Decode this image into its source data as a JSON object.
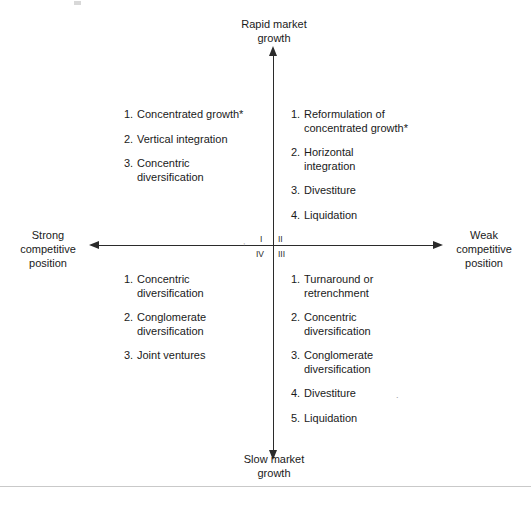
{
  "figure": {
    "type": "grand-strategy-selection-matrix",
    "axes": {
      "top_label": "Rapid market\ngrowth",
      "bottom_label": "Slow market\ngrowth",
      "left_label": "Strong\ncompetitive\nposition",
      "right_label": "Weak\ncompetitive\nposition"
    },
    "quadrant_numerals": {
      "top_left": "I",
      "top_right": "II",
      "bottom_right": "III",
      "bottom_left": "IV"
    },
    "artifacts": {
      "center_comma": ",",
      "divestiture_dot": "."
    },
    "quadrants": [
      {
        "id": "quadrant-1",
        "numeral": "I",
        "position": "top-left",
        "items": [
          {
            "num": "1.",
            "text": "Concentrated growth*"
          },
          {
            "num": "2.",
            "text": "Vertical integration"
          },
          {
            "num": "3.",
            "text": "Concentric\ndiversification"
          }
        ]
      },
      {
        "id": "quadrant-2",
        "numeral": "II",
        "position": "top-right",
        "items": [
          {
            "num": "1.",
            "text": "Reformulation of\nconcentrated growth*"
          },
          {
            "num": "2.",
            "text": "Horizontal\nintegration"
          },
          {
            "num": "3.",
            "text": "Divestiture"
          },
          {
            "num": "4.",
            "text": "Liquidation"
          }
        ]
      },
      {
        "id": "quadrant-4",
        "numeral": "IV",
        "position": "bottom-left",
        "items": [
          {
            "num": "1.",
            "text": "Concentric\ndiversification"
          },
          {
            "num": "2.",
            "text": "Conglomerate\ndiversification"
          },
          {
            "num": "3.",
            "text": "Joint ventures"
          }
        ]
      },
      {
        "id": "quadrant-3",
        "numeral": "III",
        "position": "bottom-right",
        "items": [
          {
            "num": "1.",
            "text": "Turnaround or\nretrenchment"
          },
          {
            "num": "2.",
            "text": "Concentric\ndiversification"
          },
          {
            "num": "3.",
            "text": "Conglomerate\ndiversification"
          },
          {
            "num": "4.",
            "text": "Divestiture"
          },
          {
            "num": "5.",
            "text": "Liquidation"
          }
        ]
      }
    ],
    "colors": {
      "axis": "#2b2b2b",
      "text": "#1a1a1a",
      "rule": "#c9c9c9",
      "background": "#ffffff"
    }
  }
}
